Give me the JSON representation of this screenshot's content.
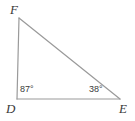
{
  "figure": {
    "type": "geometry-diagram",
    "shape": "triangle",
    "name": "Triangle DEF",
    "background_color": "#ffffff",
    "stroke_color": "#9a9a9a",
    "text_color": "#3a3a3a",
    "stroke_width": 1.2,
    "width": 135,
    "height": 121
  },
  "vertices": [
    {
      "id": "F",
      "label": "F",
      "x": 19,
      "y": 18
    },
    {
      "id": "D",
      "label": "D",
      "x": 17,
      "y": 99
    },
    {
      "id": "E",
      "label": "E",
      "x": 120,
      "y": 99
    }
  ],
  "sides": [
    {
      "id": "FD",
      "from": "F",
      "to": "D"
    },
    {
      "id": "DE",
      "from": "D",
      "to": "E"
    },
    {
      "id": "FE",
      "from": "F",
      "to": "E"
    }
  ],
  "angles": [
    {
      "at": "D",
      "label": "87°",
      "value": 87,
      "unit": "degrees"
    },
    {
      "at": "E",
      "label": "38°",
      "value": 38,
      "unit": "degrees"
    }
  ]
}
